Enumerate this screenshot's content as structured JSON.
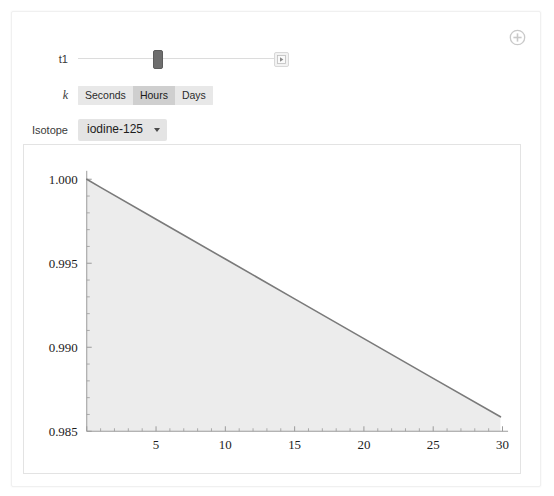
{
  "panel": {
    "add_control_icon": "circled-plus-icon"
  },
  "controls": {
    "slider": {
      "label": "t1",
      "value_fraction": 0.39,
      "animate_icon": "play-step-icon"
    },
    "setter_bar": {
      "label": "k",
      "options": [
        "Seconds",
        "Hours",
        "Days"
      ],
      "selected": "Hours"
    },
    "popup": {
      "label": "Isotope",
      "value": "iodine-125",
      "options": [
        "iodine-125"
      ],
      "arrow_icon": "triangle-down-icon"
    }
  },
  "chart_data": {
    "type": "line",
    "title": "",
    "xlabel": "",
    "ylabel": "",
    "xlim": [
      0,
      30.4
    ],
    "ylim": [
      0.985,
      1.0005
    ],
    "xticks": [
      5,
      10,
      15,
      20,
      25,
      30
    ],
    "yticks": [
      "1.000",
      "0.995",
      "0.990",
      "0.985"
    ],
    "ytick_values": [
      1.0,
      0.995,
      0.99,
      0.985
    ],
    "x_minor_per_interval": 4,
    "y_minor_per_interval": 4,
    "grid": false,
    "legend": null,
    "filled": true,
    "fill_color": "#ececec",
    "line_color": "#7a7a7a",
    "series": [
      {
        "name": "iodine-125 decay",
        "x": [
          0,
          1,
          5,
          10,
          15,
          20,
          25,
          29.85
        ],
        "y": [
          1.0,
          0.99952,
          0.99762,
          0.99525,
          0.99288,
          0.99051,
          0.98815,
          0.98586
        ]
      }
    ]
  }
}
